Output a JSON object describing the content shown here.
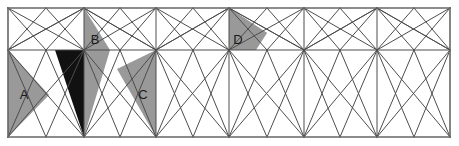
{
  "figure": {
    "width": 459,
    "height": 146,
    "background_color": "#ffffff",
    "line_color": "#4d4d4d",
    "border_color": "#666666",
    "shaded_gray": "#999999",
    "shaded_black": "#111111",
    "label_color": "#1a1a1a"
  },
  "grid": {
    "left": 8,
    "right": 450,
    "top": 8,
    "bottom": 137,
    "mid_y": 50,
    "columns_x": [
      8,
      84,
      156,
      229,
      304,
      377,
      450
    ],
    "row_lines_y": [
      8,
      50,
      137
    ],
    "cell_count": 6,
    "description": "Rectangular frame split by vertical lines and one horizontal midline; every sub-rectangle is further cut by diagonals and fan lines into triangles."
  },
  "regions": [
    {
      "id": "A",
      "label": "A",
      "fill": "#999999",
      "fill_name": "gray",
      "label_x": 24,
      "label_y": 96,
      "points": "8,50 8,137 49,95"
    },
    {
      "id": "B",
      "label": "B",
      "fill": "#111111",
      "fill_name": "black",
      "label_x": 95,
      "label_y": 41,
      "points": "84,8 84,50 55,50 84,137",
      "note": "Black quadrilateral to the left of the vertical line at x=84"
    },
    {
      "id": "B2",
      "label": "",
      "fill": "#999999",
      "fill_name": "gray",
      "label_x": 0,
      "label_y": 0,
      "points": "84,8 110,50 84,50"
    },
    {
      "id": "B3",
      "label": "",
      "fill": "#999999",
      "fill_name": "gray",
      "label_x": 0,
      "label_y": 0,
      "points": "84,50 110,50 84,137"
    },
    {
      "id": "C",
      "label": "C",
      "fill": "#999999",
      "fill_name": "gray",
      "label_x": 143,
      "label_y": 96,
      "points": "156,50 156,137 117,69"
    },
    {
      "id": "D",
      "label": "D",
      "fill": "#999999",
      "fill_name": "gray",
      "label_x": 238,
      "label_y": 41,
      "points": "229,8 229,50 267,33"
    },
    {
      "id": "D2",
      "label": "",
      "fill": "#999999",
      "fill_name": "gray",
      "label_x": 0,
      "label_y": 0,
      "points": "229,8 267,33 256,50 229,50"
    }
  ],
  "labels": [
    {
      "text": "A",
      "x": 24,
      "y": 96,
      "on_dark": false
    },
    {
      "text": "B",
      "x": 95,
      "y": 41,
      "on_dark": false
    },
    {
      "text": "C",
      "x": 143,
      "y": 96,
      "on_dark": false
    },
    {
      "text": "D",
      "x": 238,
      "y": 41,
      "on_dark": false
    }
  ],
  "lines": {
    "frame": [
      "8,8 450,8",
      "8,137 450,137",
      "8,8 8,137",
      "450,8 450,137"
    ],
    "verticals": [
      "84,8 84,137",
      "156,8 156,137",
      "229,8 229,137",
      "304,8 304,137",
      "377,8 377,137"
    ],
    "horizontals": [
      "8,50 450,50"
    ],
    "diagonals": [
      "8,8 84,50",
      "8,50 84,8",
      "8,50 84,137",
      "8,137 84,50",
      "84,8 156,50",
      "84,50 156,8",
      "84,50 156,137",
      "84,137 156,50",
      "156,8 229,50",
      "156,50 229,8",
      "156,50 229,137",
      "156,137 229,50",
      "229,8 304,50",
      "229,50 304,8",
      "229,50 304,137",
      "229,137 304,50",
      "304,8 377,50",
      "304,50 377,8",
      "304,50 377,137",
      "304,137 377,50",
      "377,8 450,50",
      "377,50 450,8",
      "377,50 450,137",
      "377,137 450,50"
    ],
    "fan_upper": [
      "8,50 46,8",
      "46,8 84,50",
      "84,50 120,8",
      "120,8 156,50",
      "156,50 193,8",
      "193,8 229,50",
      "229,50 267,8",
      "267,8 304,50",
      "304,50 340,8",
      "340,8 377,50",
      "377,50 414,8",
      "414,8 450,50"
    ],
    "fan_lower": [
      "8,137 46,50",
      "46,50 84,137",
      "84,137 120,50",
      "120,50 156,137",
      "156,137 193,50",
      "193,50 229,137",
      "229,137 267,50",
      "267,50 304,137",
      "304,137 340,50",
      "340,50 377,137",
      "377,137 414,50",
      "414,50 450,137"
    ],
    "long_upper": [
      "8,50 84,8",
      "84,8 156,50",
      "156,50 229,8",
      "229,8 304,50",
      "304,50 377,8",
      "377,8 450,50"
    ],
    "cross_upper": [
      "8,8 46,50",
      "46,50 84,8",
      "84,8 120,50",
      "120,50 156,8",
      "156,8 193,50",
      "193,50 229,8",
      "229,8 267,50",
      "267,50 304,8",
      "304,8 340,50",
      "340,50 377,8",
      "377,8 414,50",
      "414,50 450,8"
    ],
    "cross_lower": [
      "8,50 46,137",
      "46,137 84,50",
      "84,50 120,137",
      "120,137 156,50",
      "156,50 193,137",
      "193,137 229,50",
      "229,50 267,137",
      "267,137 304,50",
      "304,50 340,137",
      "340,137 377,50",
      "377,50 414,137",
      "414,137 450,50"
    ]
  }
}
